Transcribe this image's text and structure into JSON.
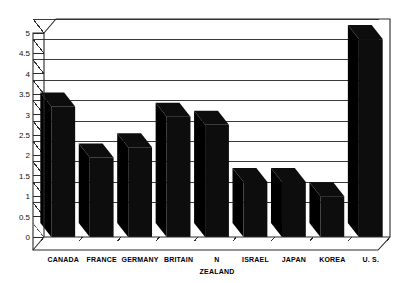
{
  "chart_data": {
    "type": "bar",
    "title": "",
    "subtitle": "",
    "xlabel": "",
    "ylabel": "",
    "categories": [
      "CANADA",
      "FRANCE",
      "GERMANY",
      "BRITAIN",
      "N ZEALAND",
      "ISRAEL",
      "JAPAN",
      "KOREA",
      "U. S."
    ],
    "category_lines": [
      [
        "CANADA"
      ],
      [
        "FRANCE"
      ],
      [
        "GERMANY"
      ],
      [
        "BRITAIN"
      ],
      [
        "N",
        "ZEALAND"
      ],
      [
        "ISRAEL"
      ],
      [
        "JAPAN"
      ],
      [
        "KOREA"
      ],
      [
        "U. S."
      ]
    ],
    "values": [
      3.2,
      1.95,
      2.2,
      2.95,
      2.75,
      1.35,
      1.35,
      1.0,
      4.85
    ],
    "ylim": [
      0,
      5
    ],
    "ytick_values": [
      0,
      0.5,
      1,
      1.5,
      2,
      2.5,
      3,
      3.5,
      4,
      4.5,
      5
    ],
    "ytick_labels": [
      "0",
      "0.5",
      "1",
      "1.5",
      "2",
      "2.5",
      "3",
      "3.5",
      "4",
      "4.5",
      "5"
    ],
    "grid": true,
    "grid_axis": "y",
    "legend": false,
    "legend_position": "none",
    "style": "3d-perspective",
    "bar_color": "#0d0d0d",
    "grid_color": "#3a3a3a",
    "frame_color": "#2b2b2b",
    "background_color": "#ffffff"
  },
  "figure": {
    "plot_area_label": "bar-chart-plot-area",
    "axis_label_y": "y-axis",
    "axis_label_x": "x-axis"
  }
}
